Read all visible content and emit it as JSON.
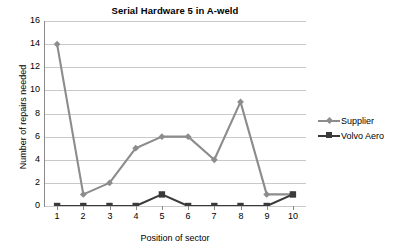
{
  "chart_data": {
    "type": "line",
    "title": "Serial Hardware 5 in A-weld",
    "xlabel": "Position of sector",
    "ylabel": "Number of repairs needed",
    "categories": [
      "1",
      "2",
      "3",
      "4",
      "5",
      "6",
      "7",
      "8",
      "9",
      "10"
    ],
    "x": [
      1,
      2,
      3,
      4,
      5,
      6,
      7,
      8,
      9,
      10
    ],
    "ylim": [
      0,
      16
    ],
    "yticks": [
      "0",
      "2",
      "4",
      "6",
      "8",
      "10",
      "12",
      "14",
      "16"
    ],
    "ytick_values": [
      0,
      2,
      4,
      6,
      8,
      10,
      12,
      14,
      16
    ],
    "grid": true,
    "legend_position": "right",
    "series": [
      {
        "name": "Supplier",
        "marker": "diamond",
        "color": "#8c8c8c",
        "values": [
          14,
          1,
          2,
          5,
          6,
          6,
          4,
          9,
          1,
          1
        ]
      },
      {
        "name": "Volvo Aero",
        "marker": "square",
        "color": "#3a3a3a",
        "values": [
          0,
          0,
          0,
          0,
          1,
          0,
          0,
          0,
          0,
          1
        ]
      }
    ]
  },
  "colors": {
    "supplier": "#8c8c8c",
    "volvo_aero": "#3a3a3a",
    "gridline": "#c9c9c9",
    "axis": "#8a8a8a",
    "background": "#ffffff",
    "text": "#000000"
  }
}
